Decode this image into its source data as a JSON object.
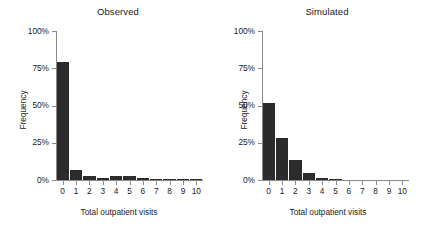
{
  "figure": {
    "background_color": "#ffffff",
    "bar_color": "#2b2b2b",
    "axis_color": "#8a8a8a",
    "text_color": "#1a1a1a"
  },
  "panels": [
    {
      "key": "observed",
      "title": "Observed",
      "ylabel": "Frequency",
      "xlabel": "Total outpatient visits"
    },
    {
      "key": "simulated",
      "title": "Simulated",
      "ylabel": "Frequency",
      "xlabel": "Total outpatient visits"
    }
  ],
  "axes": {
    "yticks": [
      0,
      25,
      50,
      75,
      100
    ],
    "ytick_labels": [
      "0%",
      "25%",
      "50%",
      "75%",
      "100%"
    ],
    "xticks": [
      0,
      1,
      2,
      3,
      4,
      5,
      6,
      7,
      8,
      9,
      10
    ],
    "xtick_labels": [
      "0",
      "1",
      "2",
      "3",
      "4",
      "5",
      "6",
      "7",
      "8",
      "9",
      "10"
    ],
    "ylim": [
      0,
      100
    ],
    "xlim": [
      -0.5,
      10.5
    ]
  },
  "chart_data": {
    "type": "bar",
    "xlabel": "Total outpatient visits",
    "ylabel": "Frequency",
    "ylim": [
      0,
      100
    ],
    "yunit": "percent",
    "grid": false,
    "legend": "none",
    "categories": [
      "0",
      "1",
      "2",
      "3",
      "4",
      "5",
      "6",
      "7",
      "8",
      "9",
      "10"
    ],
    "panels": [
      {
        "name": "Observed",
        "values": [
          79.0,
          7.0,
          3.0,
          1.5,
          3.0,
          3.0,
          1.5,
          1.0,
          1.0,
          0.8,
          0.3
        ]
      },
      {
        "name": "Simulated",
        "values": [
          52.0,
          28.0,
          13.5,
          5.0,
          1.5,
          0.3,
          0.0,
          0.0,
          0.0,
          0.0,
          0.0
        ]
      }
    ]
  }
}
